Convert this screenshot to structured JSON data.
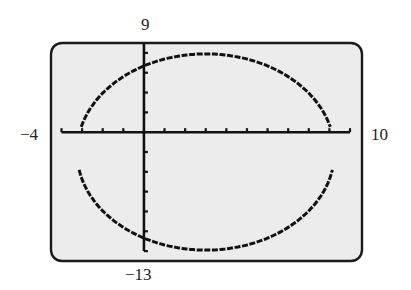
{
  "window": {
    "xmin_label": "−4",
    "xmax_label": "10",
    "ymax_label": "9",
    "ymin_label": "−13"
  },
  "colors": {
    "screen_bg": "#ececec",
    "border": "#1a1a1a",
    "ink": "#111111",
    "label": "#222222"
  },
  "chart_data": {
    "type": "line",
    "title": "",
    "xlabel": "",
    "ylabel": "",
    "xlim": [
      -4,
      10
    ],
    "ylim": [
      -13,
      9
    ],
    "xscale_tick": 1,
    "yscale_tick": 2,
    "grid": false,
    "series": [
      {
        "name": "ellipse",
        "center": [
          3,
          -2
        ],
        "semi_axis_x": 6.25,
        "semi_axis_y": 9.9,
        "upper_branch": {
          "x": [
            -3,
            -2,
            -1,
            0,
            1,
            2,
            3,
            4,
            5,
            6,
            7,
            8,
            9
          ],
          "y": [
            -0.1,
            3.2,
            5.4,
            6.6,
            7.3,
            7.8,
            7.9,
            7.8,
            7.3,
            6.6,
            5.4,
            3.2,
            -0.1
          ]
        },
        "lower_branch": {
          "x": [
            -3,
            -2,
            -1,
            0,
            1,
            2,
            3,
            4,
            5,
            6,
            7,
            8,
            9
          ],
          "y": [
            -3.6,
            -7.2,
            -9.4,
            -10.6,
            -11.3,
            -11.8,
            -11.9,
            -11.8,
            -11.3,
            -10.6,
            -9.4,
            -7.2,
            -3.6
          ]
        }
      }
    ]
  }
}
